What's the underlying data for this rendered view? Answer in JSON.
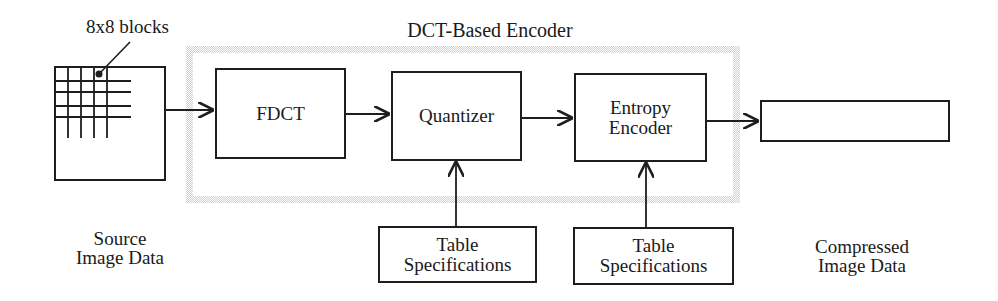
{
  "diagram": {
    "title": "DCT-Based Encoder",
    "grid_label": "8x8 blocks",
    "source_label": [
      "Source",
      "Image Data"
    ],
    "output_label": [
      "Compressed",
      "Image Data"
    ],
    "blocks": {
      "fdct": "FDCT",
      "quantizer": "Quantizer",
      "entropy_encoder": [
        "Entropy",
        "Encoder"
      ],
      "table_spec_1": [
        "Table",
        "Specifications"
      ],
      "table_spec_2": [
        "Table",
        "Specifications"
      ],
      "output_box": ""
    },
    "edges": [
      {
        "from": "source",
        "to": "fdct"
      },
      {
        "from": "fdct",
        "to": "quantizer"
      },
      {
        "from": "quantizer",
        "to": "entropy_encoder"
      },
      {
        "from": "entropy_encoder",
        "to": "output_box"
      },
      {
        "from": "table_spec_1",
        "to": "quantizer"
      },
      {
        "from": "table_spec_2",
        "to": "entropy_encoder"
      }
    ],
    "colors": {
      "line": "#1e1e1e",
      "frame": "#cfcfcf"
    }
  }
}
